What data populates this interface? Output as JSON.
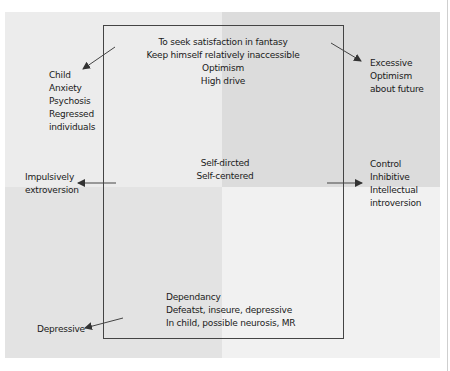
{
  "diagram": {
    "type": "quadrant-personality-diagram",
    "quadrant_colors": {
      "top_left": "#ececec",
      "top_right": "#dcdcdc",
      "bottom_left": "#e3e3e3",
      "bottom_right": "#f1f1f1"
    },
    "box": {
      "top_text": [
        "To seek satisfaction in fantasy",
        "Keep himself relatively inaccessible",
        "Optimism",
        "High drive"
      ],
      "center_text": [
        "Self-dircted",
        "Self-centered"
      ],
      "bottom_text": [
        "Dependancy",
        "Defeatst, inseure, depressive",
        "In child, possible neurosis, MR"
      ]
    },
    "outside": {
      "top_left": [
        "Child",
        "Anxiety",
        "Psychosis",
        "Regressed",
        "individuals"
      ],
      "top_right": [
        "Excessive",
        "Optimism",
        "about future"
      ],
      "middle_left": [
        "Impulsively",
        "extroversion"
      ],
      "middle_right": [
        "Control",
        "Inhibitive",
        "Intellectual",
        "introversion"
      ],
      "bottom_left": [
        "Depressive"
      ]
    },
    "arrows": [
      {
        "name": "arrow-to-top-left",
        "direction": "down-left"
      },
      {
        "name": "arrow-to-top-right",
        "direction": "down-right"
      },
      {
        "name": "arrow-to-middle-left",
        "direction": "left"
      },
      {
        "name": "arrow-to-middle-right",
        "direction": "right"
      },
      {
        "name": "arrow-to-bottom-left",
        "direction": "left"
      }
    ]
  }
}
